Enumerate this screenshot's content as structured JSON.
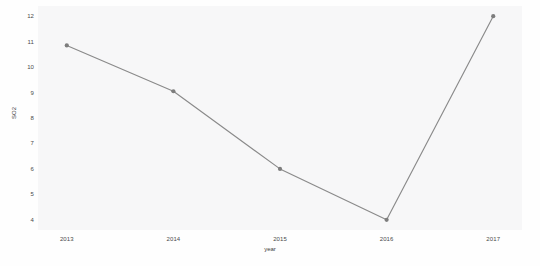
{
  "chart_data": {
    "type": "line",
    "title": "",
    "xlabel": "year",
    "ylabel": "SO2",
    "categories": [
      "2013",
      "2014",
      "2015",
      "2016",
      "2017"
    ],
    "x": [
      2013,
      2014,
      2015,
      2016,
      2017
    ],
    "values": [
      10.85,
      9.05,
      6,
      4,
      12
    ],
    "series": [
      {
        "name": "SO2",
        "values": [
          10.85,
          9.05,
          6,
          4,
          12
        ]
      }
    ],
    "xtick_labels": [
      "2013",
      "2014",
      "2015",
      "2016",
      "2017"
    ],
    "ytick_labels": [
      "4",
      "5",
      "6",
      "7",
      "8",
      "9",
      "10",
      "11",
      "12"
    ],
    "ytick_values": [
      4,
      5,
      6,
      7,
      8,
      9,
      10,
      11,
      12
    ],
    "ylim": [
      3.6,
      12.4
    ],
    "xlim": [
      2012.73,
      2017.27
    ],
    "grid": false,
    "legend": false,
    "legend_position": "none",
    "marker": "circle",
    "line_color": "#8a8a8a",
    "marker_color": "#7d7d7d",
    "plot_background": "#f7f7f8",
    "figure_background": "#fefefe",
    "tick_color": "#4a4a4a"
  }
}
